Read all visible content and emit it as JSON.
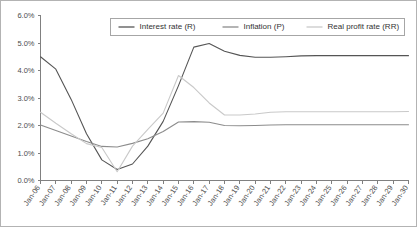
{
  "chart_data": {
    "type": "line",
    "title": "",
    "xlabel": "",
    "ylabel": "",
    "ylim": [
      0,
      6
    ],
    "ytick_values": [
      0,
      1,
      2,
      3,
      4,
      5,
      6
    ],
    "ytick_labels": [
      "0.0%",
      "1.0%",
      "2.0%",
      "3.0%",
      "4.0%",
      "5.0%",
      "6.0%"
    ],
    "grid": false,
    "legend_position": "top-center",
    "categories": [
      "Jan-06",
      "Jan-07",
      "Jan-08",
      "Jan-09",
      "Jan-10",
      "Jan-11",
      "Jan-12",
      "Jan-13",
      "Jan-14",
      "Jan-15",
      "Jan-16",
      "Jan-17",
      "Jan-18",
      "Jan-19",
      "Jan-20",
      "Jan-21",
      "Jan-22",
      "Jan-23",
      "Jan-24",
      "Jan-25",
      "Jan-26",
      "Jan-27",
      "Jan-28",
      "Jan-29",
      "Jan-30"
    ],
    "series": [
      {
        "name": "Interest rate (R)",
        "color": "#555555",
        "values": [
          4.5,
          4.05,
          2.95,
          1.7,
          0.75,
          0.4,
          0.6,
          1.25,
          2.15,
          3.45,
          4.85,
          4.98,
          4.7,
          4.55,
          4.48,
          4.48,
          4.5,
          4.53,
          4.54,
          4.54,
          4.54,
          4.54,
          4.54,
          4.54,
          4.54
        ]
      },
      {
        "name": "Inflation (P)",
        "color": "#8c8c8c",
        "values": [
          2.02,
          1.82,
          1.62,
          1.42,
          1.24,
          1.22,
          1.35,
          1.52,
          1.78,
          2.13,
          2.14,
          2.12,
          2.0,
          1.99,
          2.0,
          2.02,
          2.03,
          2.03,
          2.03,
          2.03,
          2.03,
          2.03,
          2.03,
          2.03,
          2.03
        ]
      },
      {
        "name": "Real profit rate (RR)",
        "color": "#c9c9c9",
        "values": [
          2.48,
          2.08,
          1.7,
          1.34,
          1.2,
          0.32,
          1.25,
          1.86,
          2.45,
          3.82,
          3.38,
          2.82,
          2.38,
          2.38,
          2.42,
          2.48,
          2.5,
          2.5,
          2.5,
          2.5,
          2.5,
          2.5,
          2.5,
          2.5,
          2.51
        ]
      }
    ]
  }
}
